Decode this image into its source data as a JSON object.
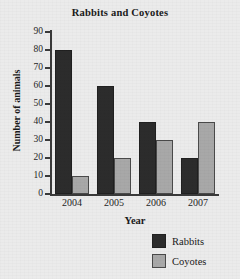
{
  "chart_data": {
    "type": "bar",
    "title": "Rabbits and Coyotes",
    "xlabel": "Year",
    "ylabel": "Number of animals",
    "categories": [
      "2004",
      "2005",
      "2006",
      "2007"
    ],
    "series": [
      {
        "name": "Rabbits",
        "color": "#2c2c2c",
        "values": [
          80,
          60,
          40,
          20
        ]
      },
      {
        "name": "Coyotes",
        "color": "#a8a8a8",
        "values": [
          10,
          20,
          30,
          40
        ]
      }
    ],
    "ylim": [
      0,
      90
    ],
    "ytick_step": 10,
    "yticks": [
      0,
      10,
      20,
      30,
      40,
      50,
      60,
      70,
      80,
      90
    ],
    "ytick_labels": [
      "0",
      "10",
      "20",
      "30",
      "40",
      "50",
      "60",
      "70",
      "80",
      "90"
    ],
    "grid": false,
    "legend_position": "bottom-right",
    "legend": [
      {
        "label": "Rabbits",
        "color": "#2c2c2c"
      },
      {
        "label": "Coyotes",
        "color": "#a8a8a8"
      }
    ]
  }
}
